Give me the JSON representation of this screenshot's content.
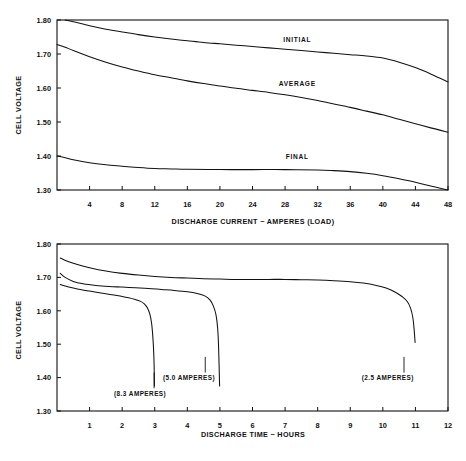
{
  "chart_data": [
    {
      "id": "top",
      "type": "line",
      "title": "",
      "xlabel": "DISCHARGE CURRENT ~ AMPERES (LOAD)",
      "ylabel": "CELL VOLTAGE",
      "xlim": [
        0,
        48
      ],
      "ylim": [
        1.3,
        1.8
      ],
      "grid": false,
      "legend_position": "inline-annotations",
      "xticks": [
        4,
        8,
        12,
        16,
        20,
        24,
        28,
        32,
        36,
        40,
        44,
        48
      ],
      "xtick_labels": [
        "4",
        "8",
        "12",
        "16",
        "20",
        "24",
        "28",
        "32",
        "36",
        "40",
        "44",
        "48"
      ],
      "yticks": [
        1.3,
        1.4,
        1.5,
        1.6,
        1.7,
        1.8
      ],
      "ytick_labels": [
        "1.30",
        "1.40",
        "1.50",
        "1.60",
        "1.70",
        "1.80"
      ],
      "series": [
        {
          "name": "INITIAL",
          "label_x": 29.5,
          "label_y": 1.735,
          "x": [
            1.0,
            2.0,
            4.0,
            6.0,
            8.0,
            10.0,
            12.0,
            14.0,
            16.0,
            18.0,
            20.0,
            22.0,
            24.0,
            26.0,
            28.0,
            30.0,
            32.0,
            34.0,
            36.0,
            38.0,
            40.0,
            42.0,
            44.0,
            46.0,
            48.0
          ],
          "y": [
            1.8,
            1.795,
            1.783,
            1.773,
            1.765,
            1.757,
            1.75,
            1.744,
            1.739,
            1.734,
            1.73,
            1.726,
            1.722,
            1.718,
            1.714,
            1.71,
            1.706,
            1.702,
            1.698,
            1.694,
            1.688,
            1.676,
            1.66,
            1.64,
            1.618
          ]
        },
        {
          "name": "AVERAGE",
          "label_x": 29.5,
          "label_y": 1.607,
          "x": [
            0.0,
            1.0,
            2.0,
            4.0,
            6.0,
            8.0,
            10.0,
            12.0,
            14.0,
            16.0,
            18.0,
            20.0,
            22.0,
            24.0,
            26.0,
            28.0,
            30.0,
            32.0,
            34.0,
            36.0,
            38.0,
            40.0,
            42.0,
            44.0,
            46.0,
            48.0
          ],
          "y": [
            1.728,
            1.72,
            1.71,
            1.692,
            1.676,
            1.662,
            1.65,
            1.639,
            1.63,
            1.621,
            1.613,
            1.606,
            1.599,
            1.593,
            1.587,
            1.58,
            1.572,
            1.563,
            1.553,
            1.543,
            1.532,
            1.521,
            1.508,
            1.495,
            1.482,
            1.47
          ]
        },
        {
          "name": "FINAL",
          "label_x": 29.5,
          "label_y": 1.392,
          "x": [
            0.0,
            1.0,
            2.0,
            4.0,
            6.0,
            8.0,
            10.0,
            12.0,
            14.0,
            16.0,
            20.0,
            24.0,
            28.0,
            32.0,
            34.0,
            36.0,
            38.0,
            40.0,
            42.0,
            44.0,
            46.0,
            48.0
          ],
          "y": [
            1.4,
            1.395,
            1.389,
            1.38,
            1.374,
            1.37,
            1.366,
            1.363,
            1.362,
            1.361,
            1.36,
            1.36,
            1.36,
            1.359,
            1.357,
            1.354,
            1.349,
            1.342,
            1.333,
            1.323,
            1.311,
            1.3
          ]
        }
      ]
    },
    {
      "id": "bottom",
      "type": "line",
      "title": "",
      "xlabel": "DISCHARGE TIME ~ HOURS",
      "ylabel": "CELL VOLTAGE",
      "xlim": [
        0,
        12
      ],
      "ylim": [
        1.3,
        1.8
      ],
      "grid": false,
      "legend_position": "inline-annotations",
      "xticks": [
        1,
        2,
        3,
        4,
        5,
        6,
        7,
        8,
        9,
        10,
        11,
        12
      ],
      "xtick_labels": [
        "1",
        "2",
        "3",
        "4",
        "5",
        "6",
        "7",
        "8",
        "9",
        "10",
        "11",
        "12"
      ],
      "yticks": [
        1.3,
        1.4,
        1.5,
        1.6,
        1.7,
        1.8
      ],
      "ytick_labels": [
        "1.30",
        "1.40",
        "1.50",
        "1.60",
        "1.70",
        "1.80"
      ],
      "series": [
        {
          "name": "(8.3 AMPERES)",
          "annotation": "(8.3 AMPERES)",
          "annot_x": 2.55,
          "annot_y": 1.345,
          "leader_from_y": 1.368,
          "leader_to_y": 1.415,
          "leader_x": 2.98,
          "x": [
            0.1,
            0.25,
            0.5,
            0.75,
            1.0,
            1.25,
            1.5,
            1.75,
            2.0,
            2.2,
            2.4,
            2.55,
            2.68,
            2.78,
            2.85,
            2.9,
            2.93,
            2.96,
            2.98,
            2.99
          ],
          "y": [
            1.679,
            1.674,
            1.668,
            1.663,
            1.659,
            1.655,
            1.651,
            1.647,
            1.643,
            1.639,
            1.634,
            1.629,
            1.621,
            1.608,
            1.59,
            1.565,
            1.537,
            1.492,
            1.44,
            1.375
          ]
        },
        {
          "name": "(5.0 AMPERES)",
          "annotation": "(5.0 AMPERES)",
          "annot_x": 4.05,
          "annot_y": 1.392,
          "leader_from_y": 1.415,
          "leader_to_y": 1.462,
          "leader_x": 4.55,
          "x": [
            0.1,
            0.25,
            0.5,
            0.8,
            1.2,
            1.6,
            2.0,
            2.4,
            2.8,
            3.2,
            3.6,
            4.0,
            4.3,
            4.55,
            4.7,
            4.8,
            4.88,
            4.93,
            4.96,
            4.99
          ],
          "y": [
            1.712,
            1.7,
            1.688,
            1.681,
            1.676,
            1.673,
            1.671,
            1.669,
            1.667,
            1.664,
            1.661,
            1.657,
            1.652,
            1.644,
            1.632,
            1.614,
            1.588,
            1.548,
            1.49,
            1.375
          ]
        },
        {
          "name": "(2.5 AMPERES)",
          "annotation": "(2.5 AMPERES)",
          "annot_x": 10.15,
          "annot_y": 1.392,
          "leader_from_y": 1.415,
          "leader_to_y": 1.462,
          "leader_x": 10.65,
          "x": [
            0.1,
            0.3,
            0.6,
            1.0,
            1.5,
            2.0,
            2.5,
            3.0,
            3.5,
            4.0,
            4.5,
            5.0,
            5.5,
            6.0,
            6.5,
            7.0,
            7.5,
            8.0,
            8.5,
            9.0,
            9.4,
            9.8,
            10.1,
            10.4,
            10.6,
            10.75,
            10.85,
            10.92,
            10.96,
            10.99
          ],
          "y": [
            1.758,
            1.749,
            1.739,
            1.729,
            1.719,
            1.712,
            1.707,
            1.703,
            1.7,
            1.698,
            1.696,
            1.695,
            1.694,
            1.694,
            1.694,
            1.694,
            1.693,
            1.692,
            1.69,
            1.687,
            1.683,
            1.676,
            1.668,
            1.655,
            1.642,
            1.628,
            1.608,
            1.58,
            1.545,
            1.505
          ]
        }
      ]
    }
  ]
}
